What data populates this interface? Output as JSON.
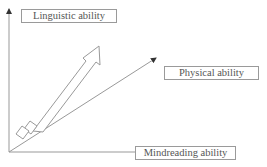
{
  "diagram": {
    "axes": {
      "y_label": "Linguistic ability",
      "x_label": "Mindreading ability"
    },
    "vectors": [
      {
        "name": "physical",
        "label": "Physical ability",
        "style": "thin-arrow"
      },
      {
        "name": "linguistic-development",
        "label": "",
        "style": "block-arrow-segmented"
      }
    ],
    "colors": {
      "line": "#888888",
      "text": "#555555",
      "box_border": "#9a9a9a"
    }
  }
}
